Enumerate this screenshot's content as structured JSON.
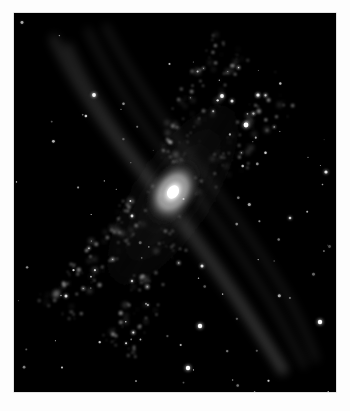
{
  "page": {
    "background_color": "#ffffff",
    "width": 350,
    "height": 411
  },
  "plate": {
    "name": "astronomical-image-plate",
    "x": 14,
    "y": 13,
    "width": 322,
    "height": 379,
    "background_color": "#000000",
    "border_color": "#c9c9c9",
    "colorization": "grayscale"
  },
  "scene": {
    "subject": "inclined spiral galaxy",
    "description": "grayscale astronomical image of a highly inclined spiral galaxy with a bright compact nucleus and knotted star-forming spiral arms on a black star field",
    "nucleus_color": "#ffffff",
    "arm_color": "#d8d8d8",
    "sky_color": "#000000"
  },
  "galaxy": {
    "name": "spiral-galaxy",
    "core": {
      "cx": 159,
      "cy": 179,
      "rx": 17,
      "ry": 12,
      "angle_deg": -57,
      "peak_color": "#ffffff"
    },
    "bulge": {
      "cx": 159,
      "cy": 179,
      "rx": 44,
      "ry": 26,
      "angle_deg": -57
    },
    "disk": {
      "cx": 159,
      "cy": 182,
      "rx": 168,
      "ry": 62,
      "angle_deg": -57
    },
    "position_angle_deg": -57,
    "arms": [
      {
        "id": "outer-arm-near",
        "offset": -26,
        "path": "M 40 26 C 55 62, 88 112, 120 152 C 152 192, 190 242, 222 288 C 244 320, 258 342, 268 358"
      },
      {
        "id": "inner-arm-near",
        "offset": -12,
        "path": "M 54 34 C 70 70, 100 118, 132 158 C 164 198, 200 246, 230 292 C 248 320, 260 340, 270 356"
      },
      {
        "id": "inner-arm-far",
        "offset": 14,
        "path": "M 74 18 C 92 56, 124 108, 158 150 C 192 192, 228 242, 256 288 C 272 316, 282 336, 290 352"
      },
      {
        "id": "outer-arm-far",
        "offset": 28,
        "path": "M 92 14 C 112 52, 146 104, 180 148 C 214 192, 248 240, 274 284 C 288 310, 296 330, 302 346"
      }
    ],
    "knot_count": 420,
    "dust_lane_count": 3
  },
  "star_field": {
    "name": "background-star-field",
    "count": 96,
    "bright_stars": [
      {
        "x": 80,
        "y": 82,
        "r": 1.9,
        "b": 0.95
      },
      {
        "x": 118,
        "y": 203,
        "r": 1.4,
        "b": 0.8
      },
      {
        "x": 208,
        "y": 83,
        "r": 1.9,
        "b": 0.95
      },
      {
        "x": 218,
        "y": 88,
        "r": 1.5,
        "b": 0.8
      },
      {
        "x": 244,
        "y": 82,
        "r": 1.6,
        "b": 0.85
      },
      {
        "x": 232,
        "y": 112,
        "r": 2.4,
        "b": 1.0
      },
      {
        "x": 312,
        "y": 159,
        "r": 1.6,
        "b": 0.85
      },
      {
        "x": 188,
        "y": 253,
        "r": 1.5,
        "b": 0.8
      },
      {
        "x": 186,
        "y": 313,
        "r": 2.2,
        "b": 1.0
      },
      {
        "x": 306,
        "y": 309,
        "r": 2.2,
        "b": 1.0
      },
      {
        "x": 174,
        "y": 355,
        "r": 2.2,
        "b": 1.0
      },
      {
        "x": 52,
        "y": 283,
        "r": 1.5,
        "b": 0.8
      },
      {
        "x": 118,
        "y": 268,
        "r": 1.2,
        "b": 0.7
      },
      {
        "x": 276,
        "y": 205,
        "r": 1.3,
        "b": 0.75
      }
    ]
  }
}
